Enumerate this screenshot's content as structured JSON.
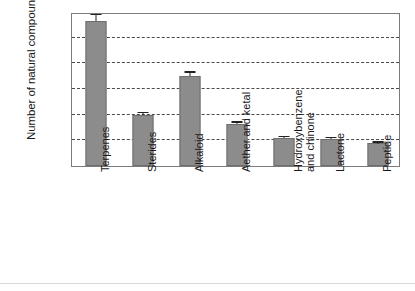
{
  "chart_data": {
    "type": "bar",
    "title": "",
    "subtitle": "",
    "xlabel": "",
    "ylabel": "Number of natural compounds",
    "ylim": [
      0,
      3000
    ],
    "ytick_labels": [
      "0",
      "500",
      "1000",
      "1500",
      "2000",
      "2500",
      "3000"
    ],
    "yticks": [
      0,
      500,
      1000,
      1500,
      2000,
      2500,
      3000
    ],
    "grid": true,
    "grid_axis": "y",
    "grid_style": "dashed",
    "legend": null,
    "legend_position": "none",
    "bar_color": "#8c8c8c",
    "bar_edge_color": "#6e6e6e",
    "error_bar_color": "#222222",
    "axis_color": "#7b7b7b",
    "categories": [
      "Terpenes",
      "Sterides",
      "Alkaloid",
      "Aether and ketal",
      "Hydroxybenzene\nand chinone",
      "Lactone",
      "Peptide"
    ],
    "values": [
      2820,
      985,
      1760,
      815,
      540,
      525,
      440
    ],
    "errors": [
      120,
      40,
      60,
      25,
      20,
      15,
      12
    ]
  }
}
